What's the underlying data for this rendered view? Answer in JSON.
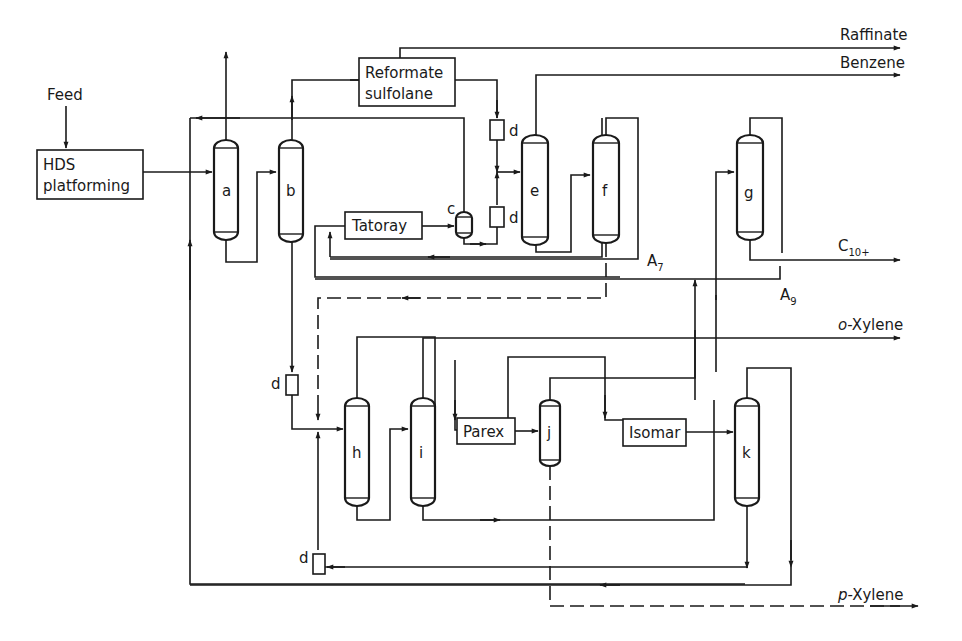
{
  "diagram": {
    "type": "process-flow",
    "units": {
      "hds": {
        "line1": "HDS",
        "line2": "platforming"
      },
      "reformate": {
        "line1": "Reformate",
        "line2": "sulfolane"
      },
      "tatoray": "Tatoray",
      "parex": "Parex",
      "isomar": "Isomar"
    },
    "inputs": {
      "feed": "Feed"
    },
    "outputs": {
      "raffinate": "Raffinate",
      "benzene": "Benzene",
      "c10": {
        "base": "C",
        "sub": "10+"
      },
      "oxylene": {
        "prefix": "o",
        "rest": "-Xylene"
      },
      "pxylene": {
        "prefix": "p",
        "rest": "-Xylene"
      }
    },
    "streams": {
      "a7": {
        "base": "A",
        "sub": "7"
      },
      "a9": {
        "base": "A",
        "sub": "9"
      }
    },
    "columns": [
      "a",
      "b",
      "c",
      "e",
      "f",
      "g",
      "h",
      "i",
      "j",
      "k"
    ],
    "drums": {
      "label": "d"
    },
    "caption": "Flowsheet of the UOP aromatics complex"
  },
  "colors": {
    "ink": "#1a1a1a",
    "background": "#ffffff"
  }
}
